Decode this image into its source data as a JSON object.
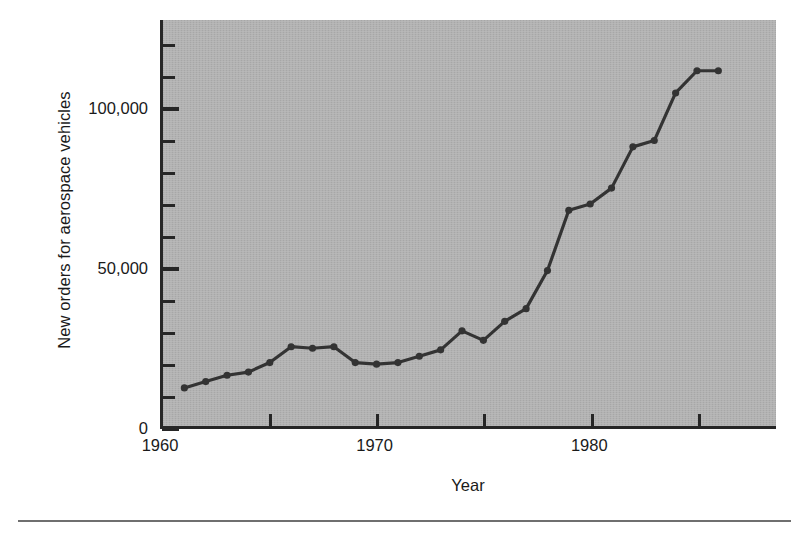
{
  "chart_data": {
    "type": "line",
    "title": "",
    "xlabel": "Year",
    "ylabel": "New orders for aerospace vehicles",
    "xlim": [
      1960,
      1988.7
    ],
    "ylim": [
      0,
      128000
    ],
    "grid": false,
    "legend": null,
    "x_ticklabels": [
      "1960",
      "1970",
      "1980"
    ],
    "x_ticklabel_years": [
      1960,
      1970,
      1980
    ],
    "x_major_tick_years": [
      1960,
      1965,
      1970,
      1975,
      1980,
      1985
    ],
    "y_ticklabels": [
      "0",
      "50,000",
      "100,000"
    ],
    "y_ticklabel_values": [
      0,
      50000,
      100000
    ],
    "y_minor_tick_values": [
      10000,
      20000,
      30000,
      40000,
      60000,
      70000,
      80000,
      90000,
      110000,
      120000
    ],
    "x": [
      1961,
      1962,
      1963,
      1964,
      1965,
      1966,
      1967,
      1968,
      1969,
      1970,
      1971,
      1972,
      1973,
      1974,
      1975,
      1976,
      1977,
      1978,
      1979,
      1980,
      1981,
      1982,
      1983,
      1984,
      1985,
      1986
    ],
    "values": [
      12000,
      14000,
      16000,
      17000,
      20000,
      25000,
      24500,
      25000,
      20000,
      19500,
      20000,
      22000,
      24000,
      30000,
      27000,
      33000,
      37000,
      49000,
      68000,
      70000,
      75000,
      88000,
      90000,
      105000,
      112000,
      112000
    ],
    "marker": "circle",
    "line_color": "#333333",
    "plot_background": "#b2b2b2"
  },
  "figure": {
    "ylabel": "New orders for aerospace vehicles",
    "xlabel": "Year"
  }
}
